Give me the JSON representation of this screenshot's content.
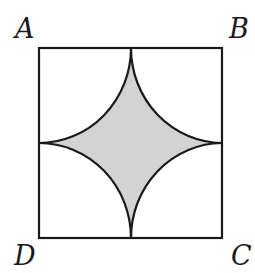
{
  "diagram": {
    "type": "geometry",
    "vertices": {
      "A": "A",
      "B": "B",
      "C": "C",
      "D": "D"
    },
    "colors": {
      "stroke": "#1a1a1a",
      "shaded_fill": "#d3d3d3",
      "background": "#ffffff"
    }
  }
}
